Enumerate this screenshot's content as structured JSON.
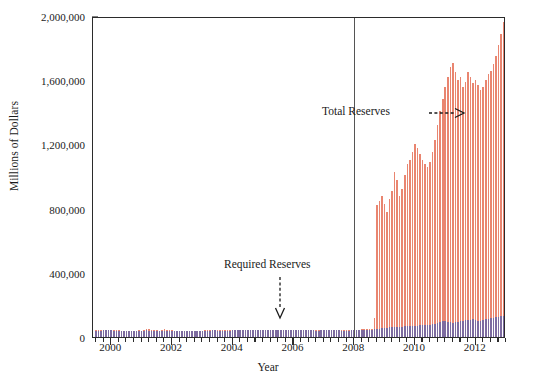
{
  "chart_data": {
    "type": "bar",
    "title": "",
    "xlabel": "Year",
    "ylabel": "Millions of Dollars",
    "ylim": [
      0,
      2000000
    ],
    "xlim": [
      1999.4,
      2013.0
    ],
    "grid": false,
    "legend_position": "none",
    "y_ticks": [
      0,
      400000,
      800000,
      1200000,
      1600000,
      2000000
    ],
    "y_tick_labels": [
      "0",
      "400,000",
      "800,000",
      "1,200,000",
      "1,600,000",
      "2,000,000"
    ],
    "x_ticks": [
      2000,
      2002,
      2004,
      2006,
      2008,
      2010,
      2012
    ],
    "x_tick_labels": [
      "2000",
      "2002",
      "2004",
      "2006",
      "2008",
      "2010",
      "2012"
    ],
    "x_minor_tick_interval": 0.25,
    "annotations": [
      {
        "name": "total-reserves",
        "text": "Total Reserves",
        "arrow": "right",
        "x": 2008.1,
        "y": 1380000
      },
      {
        "name": "required-reserves",
        "text": "Required Reserves",
        "arrow": "down",
        "x": 2006.4,
        "y": 330000
      }
    ],
    "marker_lines": [
      {
        "name": "crisis-line-2008",
        "x": 2008.0,
        "orientation": "vertical",
        "color": "#555555"
      }
    ],
    "series": [
      {
        "name": "Total Reserves",
        "color": "#e98570",
        "x": [
          1999.5,
          1999.583,
          1999.667,
          1999.75,
          1999.833,
          1999.917,
          2000.0,
          2000.083,
          2000.167,
          2000.25,
          2000.333,
          2000.417,
          2000.5,
          2000.583,
          2000.667,
          2000.75,
          2000.833,
          2000.917,
          2001.0,
          2001.083,
          2001.167,
          2001.25,
          2001.333,
          2001.417,
          2001.5,
          2001.583,
          2001.667,
          2001.75,
          2001.833,
          2001.917,
          2002.0,
          2002.083,
          2002.167,
          2002.25,
          2002.333,
          2002.417,
          2002.5,
          2002.583,
          2002.667,
          2002.75,
          2002.833,
          2002.917,
          2003.0,
          2003.083,
          2003.167,
          2003.25,
          2003.333,
          2003.417,
          2003.5,
          2003.583,
          2003.667,
          2003.75,
          2003.833,
          2003.917,
          2004.0,
          2004.083,
          2004.167,
          2004.25,
          2004.333,
          2004.417,
          2004.5,
          2004.583,
          2004.667,
          2004.75,
          2004.833,
          2004.917,
          2005.0,
          2005.083,
          2005.167,
          2005.25,
          2005.333,
          2005.417,
          2005.5,
          2005.583,
          2005.667,
          2005.75,
          2005.833,
          2005.917,
          2006.0,
          2006.083,
          2006.167,
          2006.25,
          2006.333,
          2006.417,
          2006.5,
          2006.583,
          2006.667,
          2006.75,
          2006.833,
          2006.917,
          2007.0,
          2007.083,
          2007.167,
          2007.25,
          2007.333,
          2007.417,
          2007.5,
          2007.583,
          2007.667,
          2007.75,
          2007.833,
          2007.917,
          2008.0,
          2008.083,
          2008.167,
          2008.25,
          2008.333,
          2008.417,
          2008.5,
          2008.583,
          2008.667,
          2008.75,
          2008.833,
          2008.917,
          2009.0,
          2009.083,
          2009.167,
          2009.25,
          2009.333,
          2009.417,
          2009.5,
          2009.583,
          2009.667,
          2009.75,
          2009.833,
          2009.917,
          2010.0,
          2010.083,
          2010.167,
          2010.25,
          2010.333,
          2010.417,
          2010.5,
          2010.583,
          2010.667,
          2010.75,
          2010.833,
          2010.917,
          2011.0,
          2011.083,
          2011.167,
          2011.25,
          2011.333,
          2011.417,
          2011.5,
          2011.583,
          2011.667,
          2011.75,
          2011.833,
          2011.917,
          2012.0,
          2012.083,
          2012.167,
          2012.25,
          2012.333,
          2012.417,
          2012.5,
          2012.583,
          2012.667,
          2012.75,
          2012.833,
          2012.917
        ],
        "values": [
          42000,
          41500,
          42000,
          43000,
          44500,
          46000,
          44000,
          42500,
          41500,
          41000,
          40500,
          40000,
          39500,
          39000,
          39000,
          38500,
          39500,
          41000,
          40000,
          42000,
          47000,
          50000,
          45000,
          42000,
          41000,
          40500,
          46000,
          48000,
          44000,
          42500,
          41000,
          40500,
          40000,
          39500,
          39500,
          39000,
          39000,
          38500,
          38500,
          38000,
          38500,
          39500,
          40000,
          41000,
          42000,
          42500,
          43000,
          43000,
          42500,
          42000,
          41500,
          41000,
          41000,
          42000,
          43000,
          43500,
          44000,
          44500,
          45000,
          45500,
          45500,
          45000,
          44500,
          44000,
          44000,
          45000,
          45500,
          46000,
          46500,
          46500,
          46000,
          45500,
          45000,
          44500,
          44500,
          44000,
          44000,
          44500,
          45000,
          45500,
          45500,
          45000,
          44500,
          44000,
          43500,
          43000,
          43000,
          42500,
          42500,
          43000,
          43500,
          44000,
          44500,
          44500,
          44000,
          43500,
          43000,
          42500,
          42500,
          42000,
          42000,
          43000,
          44000,
          45000,
          46000,
          47000,
          48000,
          49000,
          50000,
          52000,
          120000,
          820000,
          850000,
          880000,
          830000,
          780000,
          860000,
          910000,
          1030000,
          980000,
          880000,
          920000,
          1010000,
          1080000,
          1100000,
          1150000,
          1200000,
          1180000,
          1140000,
          1100000,
          1080000,
          1060000,
          1090000,
          1150000,
          1230000,
          1320000,
          1410000,
          1480000,
          1560000,
          1620000,
          1680000,
          1710000,
          1650000,
          1600000,
          1620000,
          1560000,
          1590000,
          1650000,
          1620000,
          1580000,
          1600000,
          1570000,
          1540000,
          1560000,
          1600000,
          1640000,
          1660000,
          1700000,
          1750000,
          1820000,
          1890000,
          1960000
        ]
      },
      {
        "name": "Required Reserves",
        "color": "#7d6ba0",
        "x": [
          1999.5,
          1999.583,
          1999.667,
          1999.75,
          1999.833,
          1999.917,
          2000.0,
          2000.083,
          2000.167,
          2000.25,
          2000.333,
          2000.417,
          2000.5,
          2000.583,
          2000.667,
          2000.75,
          2000.833,
          2000.917,
          2001.0,
          2001.083,
          2001.167,
          2001.25,
          2001.333,
          2001.417,
          2001.5,
          2001.583,
          2001.667,
          2001.75,
          2001.833,
          2001.917,
          2002.0,
          2002.083,
          2002.167,
          2002.25,
          2002.333,
          2002.417,
          2002.5,
          2002.583,
          2002.667,
          2002.75,
          2002.833,
          2002.917,
          2003.0,
          2003.083,
          2003.167,
          2003.25,
          2003.333,
          2003.417,
          2003.5,
          2003.583,
          2003.667,
          2003.75,
          2003.833,
          2003.917,
          2004.0,
          2004.083,
          2004.167,
          2004.25,
          2004.333,
          2004.417,
          2004.5,
          2004.583,
          2004.667,
          2004.75,
          2004.833,
          2004.917,
          2005.0,
          2005.083,
          2005.167,
          2005.25,
          2005.333,
          2005.417,
          2005.5,
          2005.583,
          2005.667,
          2005.75,
          2005.833,
          2005.917,
          2006.0,
          2006.083,
          2006.167,
          2006.25,
          2006.333,
          2006.417,
          2006.5,
          2006.583,
          2006.667,
          2006.75,
          2006.833,
          2006.917,
          2007.0,
          2007.083,
          2007.167,
          2007.25,
          2007.333,
          2007.417,
          2007.5,
          2007.583,
          2007.667,
          2007.75,
          2007.833,
          2007.917,
          2008.0,
          2008.083,
          2008.167,
          2008.25,
          2008.333,
          2008.417,
          2008.5,
          2008.583,
          2008.667,
          2008.75,
          2008.833,
          2008.917,
          2009.0,
          2009.083,
          2009.167,
          2009.25,
          2009.333,
          2009.417,
          2009.5,
          2009.583,
          2009.667,
          2009.75,
          2009.833,
          2009.917,
          2010.0,
          2010.083,
          2010.167,
          2010.25,
          2010.333,
          2010.417,
          2010.5,
          2010.583,
          2010.667,
          2010.75,
          2010.833,
          2010.917,
          2011.0,
          2011.083,
          2011.167,
          2011.25,
          2011.333,
          2011.417,
          2011.5,
          2011.583,
          2011.667,
          2011.75,
          2011.833,
          2011.917,
          2012.0,
          2012.083,
          2012.167,
          2012.25,
          2012.333,
          2012.417,
          2012.5,
          2012.583,
          2012.667,
          2012.75,
          2012.833,
          2012.917
        ],
        "values": [
          40000,
          39500,
          40000,
          41000,
          42500,
          44000,
          42000,
          40500,
          39500,
          39000,
          38500,
          38000,
          37500,
          37000,
          37000,
          36500,
          37500,
          39000,
          38000,
          40000,
          45000,
          38000,
          37000,
          36500,
          36000,
          36000,
          38000,
          39000,
          38500,
          38000,
          37500,
          37000,
          37000,
          36500,
          36500,
          36500,
          36500,
          36000,
          36000,
          36000,
          36500,
          37500,
          38000,
          39000,
          40000,
          40500,
          41000,
          41000,
          40500,
          40000,
          39500,
          39000,
          39000,
          40000,
          41000,
          41500,
          42000,
          42500,
          43000,
          43500,
          43500,
          43000,
          42500,
          42000,
          42000,
          43000,
          43500,
          44000,
          44500,
          44500,
          44000,
          43500,
          43000,
          42500,
          42500,
          42000,
          42000,
          42500,
          43000,
          43500,
          43500,
          43000,
          42500,
          42000,
          41500,
          41000,
          41000,
          40500,
          40500,
          41000,
          41500,
          42000,
          42500,
          42500,
          42000,
          41500,
          41000,
          40500,
          40500,
          40000,
          40000,
          41000,
          42000,
          43000,
          43500,
          44000,
          44500,
          45000,
          45500,
          46000,
          48000,
          50000,
          52000,
          54000,
          56000,
          58000,
          60000,
          61000,
          62000,
          63000,
          64000,
          65000,
          66000,
          67000,
          68000,
          69000,
          70000,
          71000,
          72000,
          73000,
          74000,
          75000,
          76000,
          78000,
          80000,
          88000,
          96000,
          102000,
          98000,
          94000,
          92000,
          90000,
          92000,
          95000,
          98000,
          100000,
          103000,
          106000,
          108000,
          110000,
          104000,
          100000,
          102000,
          106000,
          110000,
          114000,
          118000,
          121000,
          124000,
          127000,
          130000,
          133000
        ]
      }
    ]
  }
}
